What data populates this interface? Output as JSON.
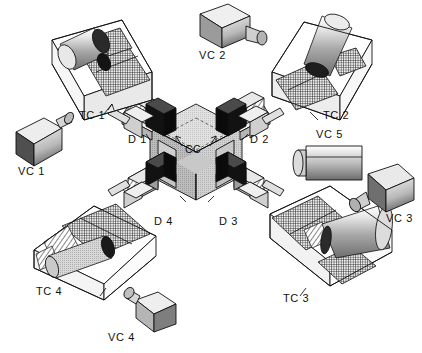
{
  "figure": {
    "type": "technical-isometric-diagram",
    "background_color": "#ffffff",
    "line_color": "#111111"
  },
  "center": {
    "label": "CC",
    "name": "central-cube"
  },
  "detectors": [
    {
      "label": "D 1",
      "name": "detector-1"
    },
    {
      "label": "D 2",
      "name": "detector-2"
    },
    {
      "label": "D 3",
      "name": "detector-3"
    },
    {
      "label": "D 4",
      "name": "detector-4"
    }
  ],
  "target_chambers": [
    {
      "label": "TC 1",
      "name": "target-chamber-1"
    },
    {
      "label": "TC 2",
      "name": "target-chamber-2"
    },
    {
      "label": "TC 3",
      "name": "target-chamber-3"
    },
    {
      "label": "TC 4",
      "name": "target-chamber-4"
    }
  ],
  "cameras": [
    {
      "label": "VC 1",
      "name": "video-camera-1"
    },
    {
      "label": "VC 2",
      "name": "video-camera-2"
    },
    {
      "label": "VC 3",
      "name": "video-camera-3"
    },
    {
      "label": "VC 4",
      "name": "video-camera-4"
    },
    {
      "label": "VC 5",
      "name": "video-camera-5"
    }
  ]
}
